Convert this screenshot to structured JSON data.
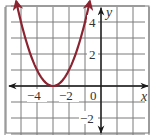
{
  "chart_data": {
    "type": "line",
    "title": "",
    "function": "y = (x + 3)^2",
    "xlabel": "x",
    "ylabel": "y",
    "xlim": [
      -6,
      3
    ],
    "ylim": [
      -3,
      5
    ],
    "grid": true,
    "grid_step": 1,
    "x_tick_labels": [
      {
        "value": -4,
        "label": "−4"
      },
      {
        "value": -2,
        "label": "−2"
      },
      {
        "value": 0,
        "label": "0"
      }
    ],
    "y_tick_labels": [
      {
        "value": 4,
        "label": "4"
      },
      {
        "value": 2,
        "label": "2"
      },
      {
        "value": -2,
        "label": "−2"
      }
    ],
    "series": [
      {
        "name": "parabola",
        "color": "#8B2331",
        "vertex": [
          -3,
          0
        ],
        "x": [
          -5.3,
          -5,
          -4.5,
          -4,
          -3.5,
          -3,
          -2.5,
          -2,
          -1.5,
          -1,
          -0.7
        ],
        "y": [
          5.29,
          4,
          2.25,
          1,
          0.25,
          0,
          0.25,
          1,
          2.25,
          4,
          5.29
        ],
        "arrows_at_ends": true
      }
    ],
    "legend": null
  },
  "labels": {
    "x_axis": "x",
    "y_axis": "y",
    "origin": "0",
    "x_neg4": "−4",
    "x_neg2": "−2",
    "y_4": "4",
    "y_2": "2",
    "y_neg2": "−2"
  },
  "colors": {
    "curve": "#8B2331",
    "grid": "#7a7a7a",
    "axis": "#1a1a1a",
    "border": "#7a7a7a"
  }
}
